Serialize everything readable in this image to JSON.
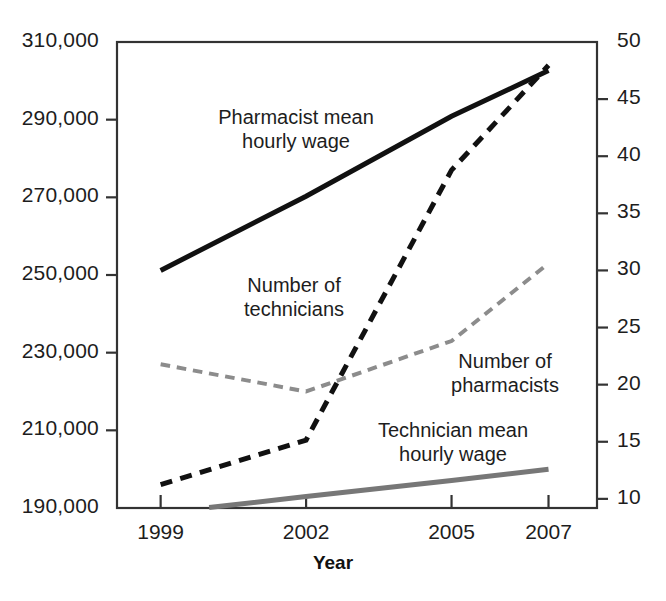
{
  "chart_data": {
    "type": "line",
    "title": "",
    "subtitle": "",
    "xlabel": "Year",
    "x": [
      1999,
      2002,
      2005,
      2007
    ],
    "xtick_labels": [
      "1999",
      "2002",
      "2005",
      "2007"
    ],
    "grid": false,
    "legend_position": "inline-annotations",
    "axes": {
      "left": {
        "label": "",
        "ylim": [
          190000,
          310000
        ],
        "ticks": [
          190000,
          210000,
          230000,
          250000,
          270000,
          290000,
          310000
        ],
        "tick_labels": [
          "190,000",
          "210,000",
          "230,000",
          "250,000",
          "270,000",
          "290,000",
          "310,000"
        ]
      },
      "right": {
        "label": "",
        "ylim": [
          9.2,
          50
        ],
        "ticks": [
          10,
          15,
          20,
          25,
          30,
          35,
          40,
          45,
          50
        ],
        "tick_labels": [
          "10",
          "15",
          "20",
          "25",
          "30",
          "35",
          "40",
          "45",
          "50"
        ]
      }
    },
    "series": [
      {
        "name": "Pharmacist mean hourly wage",
        "annotation": "Pharmacist mean\nhourly wage",
        "annotation_line1": "Pharmacist mean",
        "annotation_line2": "hourly wage",
        "axis": "right",
        "style": "solid",
        "color": "#111111",
        "width": 5,
        "x": [
          1999,
          2002,
          2005,
          2007
        ],
        "values": [
          30.0,
          36.5,
          43.5,
          47.5
        ]
      },
      {
        "name": "Number of technicians",
        "annotation": "Number of\ntechnicians",
        "annotation_line1": "Number of",
        "annotation_line2": "technicians",
        "axis": "left",
        "style": "dashed",
        "color": "#111111",
        "width": 5,
        "x": [
          1999,
          2002,
          2005,
          2007
        ],
        "values": [
          196000,
          207500,
          277000,
          304000
        ]
      },
      {
        "name": "Number of pharmacists",
        "annotation": "Number of\npharmacists",
        "annotation_line1": "Number of",
        "annotation_line2": "pharmacists",
        "axis": "left",
        "style": "dashed",
        "color": "#8c8c8c",
        "width": 4,
        "x": [
          1999,
          2002,
          2005,
          2007
        ],
        "values": [
          227000,
          220000,
          233000,
          253000
        ]
      },
      {
        "name": "Technician mean hourly wage",
        "annotation": "Technician mean\nhourly wage",
        "annotation_line1": "Technician mean",
        "annotation_line2": "hourly wage",
        "axis": "right",
        "style": "solid",
        "color": "#777777",
        "width": 5,
        "x": [
          2000,
          2002,
          2005,
          2007
        ],
        "values": [
          9.25,
          10.2,
          11.6,
          12.6
        ]
      }
    ],
    "colors": {
      "axis": "#333333",
      "text": "#1d1d1d",
      "dark_series": "#111111",
      "gray_series": "#8c8c8c",
      "background": "#ffffff"
    }
  }
}
